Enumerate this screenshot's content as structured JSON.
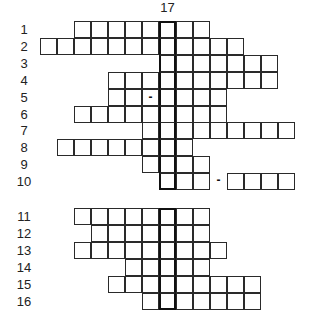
{
  "puzzle": {
    "type": "crossword",
    "key_column_label": "17",
    "key_column_index": 7,
    "grids": [
      {
        "name": "grid-1",
        "top": 21,
        "rows": [
          {
            "label": "1",
            "start": 2,
            "end": 9
          },
          {
            "label": "2",
            "start": 0,
            "end": 11
          },
          {
            "label": "3",
            "start": 7,
            "end": 13
          },
          {
            "label": "4",
            "start": 4,
            "end": 13
          },
          {
            "label": "5",
            "start": 4,
            "end": 10,
            "dash_in_cell": 6
          },
          {
            "label": "6",
            "start": 2,
            "end": 10
          },
          {
            "label": "7",
            "start": 6,
            "end": 14
          },
          {
            "label": "8",
            "start": 1,
            "end": 8
          },
          {
            "label": "9",
            "start": 6,
            "end": 9
          },
          {
            "label": "10",
            "start": 7,
            "end": 14,
            "gap_dash": 10
          }
        ]
      },
      {
        "name": "grid-2",
        "top": 208,
        "rows": [
          {
            "label": "11",
            "start": 2,
            "end": 9
          },
          {
            "label": "12",
            "start": 3,
            "end": 9
          },
          {
            "label": "13",
            "start": 2,
            "end": 10
          },
          {
            "label": "14",
            "start": 5,
            "end": 9
          },
          {
            "label": "15",
            "start": 4,
            "end": 12
          },
          {
            "label": "16",
            "start": 6,
            "end": 12
          }
        ]
      }
    ],
    "dash_glyph": "-"
  }
}
